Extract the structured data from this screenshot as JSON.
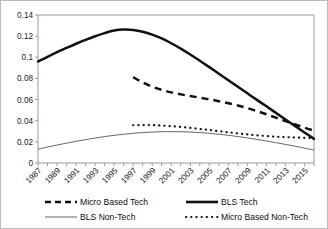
{
  "chart_data": {
    "type": "line",
    "title": "",
    "xlabel": "",
    "ylabel": "",
    "xlim": [
      1987,
      2016
    ],
    "ylim": [
      0,
      0.14
    ],
    "grid": false,
    "legend_position": "bottom",
    "yticks": [
      "0",
      "0.02",
      "0.04",
      "0.06",
      "0.08",
      "0.1",
      "0.12",
      "0.14"
    ],
    "ytick_values": [
      0,
      0.02,
      0.04,
      0.06,
      0.08,
      0.1,
      0.12,
      0.14
    ],
    "xticks": [
      "1987",
      "1989",
      "1991",
      "1993",
      "1995",
      "1997",
      "1999",
      "2001",
      "2003",
      "2005",
      "2007",
      "2009",
      "2011",
      "2013",
      "2015"
    ],
    "xtick_values": [
      1987,
      1989,
      1991,
      1993,
      1995,
      1997,
      1999,
      2001,
      2003,
      2005,
      2007,
      2009,
      2011,
      2013,
      2015
    ],
    "x_minor_step": 1,
    "series": [
      {
        "name": "BLS Tech",
        "style": "thick-solid",
        "x": [
          1987,
          1988,
          1989,
          1990,
          1991,
          1992,
          1993,
          1994,
          1995,
          1996,
          1997,
          1998,
          1999,
          2000,
          2001,
          2002,
          2003,
          2004,
          2005,
          2006,
          2007,
          2008,
          2009,
          2010,
          2011,
          2012,
          2013,
          2014,
          2015,
          2016
        ],
        "values": [
          0.096,
          0.1005,
          0.1048,
          0.1088,
          0.1128,
          0.1165,
          0.1199,
          0.1229,
          0.1253,
          0.1262,
          0.1258,
          0.1242,
          0.1215,
          0.1178,
          0.1133,
          0.1082,
          0.1026,
          0.0967,
          0.0907,
          0.0845,
          0.0783,
          0.0721,
          0.0659,
          0.0597,
          0.0536,
          0.0474,
          0.0412,
          0.0351,
          0.0289,
          0.0228
        ]
      },
      {
        "name": "Micro Based Tech",
        "style": "thick-dashed",
        "x": [
          1997,
          1998,
          1999,
          2000,
          2001,
          2002,
          2003,
          2004,
          2005,
          2006,
          2007,
          2008,
          2009,
          2010,
          2011,
          2012,
          2013,
          2014,
          2015,
          2016
        ],
        "values": [
          0.0812,
          0.0762,
          0.0722,
          0.0692,
          0.0668,
          0.0649,
          0.0633,
          0.0618,
          0.0602,
          0.0585,
          0.0566,
          0.0544,
          0.0519,
          0.0491,
          0.0461,
          0.0429,
          0.0397,
          0.0365,
          0.0334,
          0.0305
        ]
      },
      {
        "name": "BLS Non-Tech",
        "style": "thin-solid",
        "x": [
          1987,
          1988,
          1989,
          1990,
          1991,
          1992,
          1993,
          1994,
          1995,
          1996,
          1997,
          1998,
          1999,
          2000,
          2001,
          2002,
          2003,
          2004,
          2005,
          2006,
          2007,
          2008,
          2009,
          2010,
          2011,
          2012,
          2013,
          2014,
          2015,
          2016
        ],
        "values": [
          0.0131,
          0.0151,
          0.017,
          0.0188,
          0.0205,
          0.0221,
          0.0236,
          0.025,
          0.0262,
          0.0272,
          0.0281,
          0.0288,
          0.0293,
          0.0296,
          0.0297,
          0.0296,
          0.0293,
          0.0288,
          0.0281,
          0.0272,
          0.0262,
          0.025,
          0.0237,
          0.0223,
          0.0208,
          0.0192,
          0.0176,
          0.0159,
          0.0141,
          0.0123
        ]
      },
      {
        "name": "Micro Based Non-Tech",
        "style": "dotted",
        "x": [
          1997,
          1998,
          1999,
          2000,
          2001,
          2002,
          2003,
          2004,
          2005,
          2006,
          2007,
          2008,
          2009,
          2010,
          2011,
          2012,
          2013,
          2014,
          2015,
          2016
        ],
        "values": [
          0.0357,
          0.0359,
          0.0358,
          0.0354,
          0.0348,
          0.0341,
          0.0332,
          0.0322,
          0.0312,
          0.0301,
          0.029,
          0.028,
          0.027,
          0.0262,
          0.0255,
          0.0249,
          0.0245,
          0.0241,
          0.0238,
          0.0235
        ]
      }
    ],
    "legend": [
      {
        "label": "Micro Based Tech",
        "style": "thick-dashed"
      },
      {
        "label": "BLS Tech",
        "style": "thick-solid"
      },
      {
        "label": "BLS Non-Tech",
        "style": "thin-solid"
      },
      {
        "label": "Micro Based Non-Tech",
        "style": "dotted"
      }
    ]
  }
}
